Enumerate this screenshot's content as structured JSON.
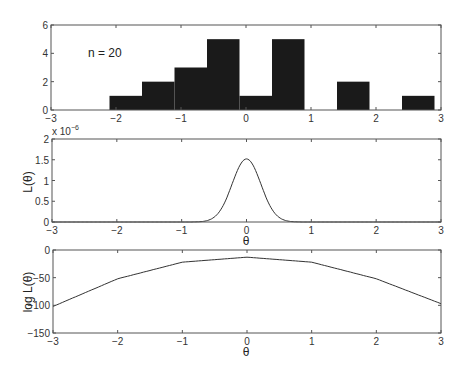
{
  "chart_data": [
    {
      "type": "bar",
      "title": "",
      "annotation": "n = 20",
      "xlabel": "",
      "ylabel": "",
      "xlim": [
        -3,
        3
      ],
      "ylim": [
        0,
        6
      ],
      "xticks": [
        "-3",
        "-2",
        "-1",
        "0",
        "1",
        "2",
        "3"
      ],
      "yticks": [
        "0",
        "2",
        "4",
        "6"
      ],
      "bins": [
        {
          "left": -2.1,
          "right": -1.6,
          "count": 1
        },
        {
          "left": -1.6,
          "right": -1.1,
          "count": 2
        },
        {
          "left": -1.1,
          "right": -0.6,
          "count": 3
        },
        {
          "left": -0.6,
          "right": -0.1,
          "count": 5
        },
        {
          "left": -0.1,
          "right": 0.4,
          "count": 1
        },
        {
          "left": 0.4,
          "right": 0.9,
          "count": 5
        },
        {
          "left": 0.9,
          "right": 1.4,
          "count": 0
        },
        {
          "left": 1.4,
          "right": 1.9,
          "count": 2
        },
        {
          "left": 1.9,
          "right": 2.4,
          "count": 0
        },
        {
          "left": 2.4,
          "right": 2.9,
          "count": 1
        }
      ],
      "grid": false
    },
    {
      "type": "line",
      "title": "",
      "xlabel": "θ",
      "ylabel": "L(θ)",
      "y_multiplier": "x 10^-6",
      "xlim": [
        -3,
        3
      ],
      "ylim": [
        0,
        2
      ],
      "xticks": [
        "-3",
        "-2",
        "-1",
        "0",
        "1",
        "2",
        "3"
      ],
      "yticks": [
        "0",
        "0.5",
        "1",
        "1.5",
        "2"
      ],
      "series": [
        {
          "name": "L(θ)",
          "peak_x": 0.0,
          "peak_y": 1.52,
          "sigma": 0.22
        }
      ],
      "grid": false
    },
    {
      "type": "line",
      "title": "",
      "xlabel": "θ",
      "ylabel": "log L(θ)",
      "xlim": [
        -3,
        3
      ],
      "ylim": [
        -150,
        0
      ],
      "xticks": [
        "-3",
        "-2",
        "-1",
        "0",
        "1",
        "2",
        "3"
      ],
      "yticks": [
        "-150",
        "-100",
        "-50",
        "0"
      ],
      "series": [
        {
          "name": "log L(θ)",
          "x": [
            -3,
            -2,
            -1,
            0,
            1,
            2,
            3
          ],
          "y": [
            -102,
            -52,
            -22,
            -13,
            -22,
            -52,
            -97
          ]
        }
      ],
      "grid": false
    }
  ],
  "labels": {
    "n_annotation": "n = 20",
    "exp_label": "x 10",
    "exp_power": "−6",
    "theta": "θ",
    "L_theta": "L(θ)",
    "logL_theta": "log L(θ)"
  },
  "colors": {
    "bar": "#1a1a1a",
    "axis": "#555555",
    "line": "#333333"
  }
}
